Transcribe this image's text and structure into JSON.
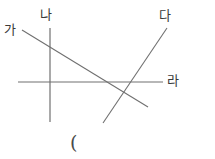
{
  "figure": {
    "background_color": "#ffffff",
    "line_color": "#707070",
    "text_color": "#3a3a3a",
    "width": 215,
    "height": 159,
    "labels": {
      "ga": "가",
      "na": "나",
      "da": "다",
      "ra": "라"
    },
    "paren": "(",
    "lines": {
      "horizontal_axis": {
        "x1": 18,
        "y1": 82,
        "x2": 163,
        "y2": 82
      },
      "vertical_axis": {
        "x1": 50,
        "y1": 28,
        "x2": 50,
        "y2": 122
      },
      "descending_line": {
        "x1": 22,
        "y1": 30,
        "x2": 148,
        "y2": 107
      },
      "rising_line": {
        "x1": 103,
        "y1": 123,
        "x2": 167,
        "y2": 28
      }
    }
  }
}
